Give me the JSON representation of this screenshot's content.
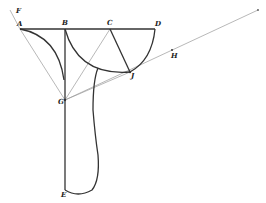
{
  "diagram": {
    "type": "geometric-construction",
    "points": {
      "A": {
        "label": "A",
        "x": 20,
        "y": 29
      },
      "B": {
        "label": "B",
        "x": 65,
        "y": 29
      },
      "C": {
        "label": "C",
        "x": 110,
        "y": 29
      },
      "D": {
        "label": "D",
        "x": 155,
        "y": 29
      },
      "E": {
        "label": "E",
        "x": 65,
        "y": 190
      },
      "F": {
        "label": "F",
        "x": 14,
        "y": 14
      },
      "G": {
        "label": "G",
        "x": 65,
        "y": 100
      },
      "H": {
        "label": "H",
        "x": 172,
        "y": 52
      },
      "J": {
        "label": "J",
        "x": 130,
        "y": 72
      }
    },
    "labels": [
      "A",
      "B",
      "C",
      "D",
      "E",
      "F",
      "G",
      "H",
      "J"
    ],
    "colors": {
      "thick_line": "#333333",
      "thin_line": "#999999",
      "background": "#ffffff"
    }
  }
}
